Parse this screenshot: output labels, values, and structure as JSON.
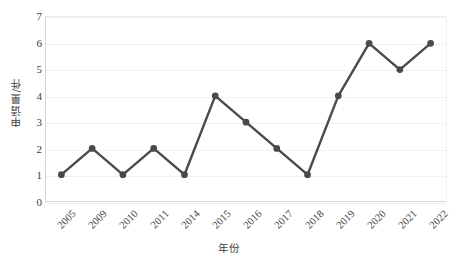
{
  "chart_data": {
    "type": "line",
    "title": "",
    "xlabel": "年份",
    "ylabel": "申请量/件",
    "categories": [
      "2005",
      "2009",
      "2010",
      "2011",
      "2014",
      "2015",
      "2016",
      "2017",
      "2018",
      "2019",
      "2020",
      "2021",
      "2022"
    ],
    "values": [
      1,
      2,
      1,
      2,
      1,
      4,
      3,
      2,
      1,
      4,
      6,
      5,
      6
    ],
    "series": [
      {
        "name": "申请量",
        "values": [
          1,
          2,
          1,
          2,
          1,
          4,
          3,
          2,
          1,
          4,
          6,
          5,
          6
        ]
      }
    ],
    "ylim": [
      0,
      7
    ],
    "yticks": [
      0,
      1,
      2,
      3,
      4,
      5,
      6,
      7
    ],
    "ytick_labels": [
      "0",
      "1",
      "2",
      "3",
      "4",
      "5",
      "6",
      "7"
    ],
    "grid": true,
    "grid_axis": "y",
    "legend": false,
    "legend_position": "none",
    "line_color": "#4a4a4a",
    "marker_color": "#4a4a4a",
    "marker": "circle",
    "background_color": "#ffffff",
    "gridline_color": "#f1f1f1",
    "axis_color": "#d6d6d6",
    "xtick_rotation": -45,
    "data_labels": false
  }
}
